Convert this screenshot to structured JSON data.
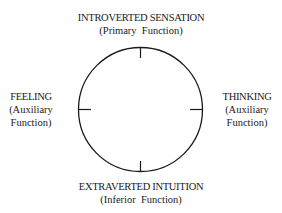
{
  "diagram": {
    "type": "function-circle",
    "stroke_color": "#1a1a1a",
    "top": {
      "title": "INTROVERTED SENSATION",
      "subtitle": "(Primary  Function)"
    },
    "left": {
      "title": "FEELING",
      "subtitle_line1": "(Auxiliary",
      "subtitle_line2": "Function)"
    },
    "right": {
      "title": "THINKING",
      "subtitle_line1": "(Auxiliary",
      "subtitle_line2": "Function)"
    },
    "bottom": {
      "title": "EXTRAVERTED INTUITION",
      "subtitle": "(Inferior  Function)"
    }
  }
}
